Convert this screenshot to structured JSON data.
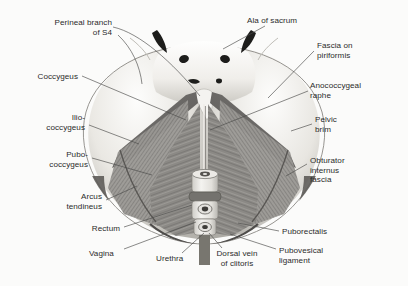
{
  "figure": {
    "view": "superior (from above)",
    "style": "grayscale anatomical illustration with leader-line labels",
    "palette": {
      "background": "#fbfbfa",
      "bone_light": "#f2f1ee",
      "bone_mid": "#cfcdc7",
      "bone_shadow": "#9a9892",
      "muscle_dark": "#6d6b68",
      "muscle_mid": "#8a8885",
      "muscle_hatch": "#7e7c79",
      "fascia": "#aeaca7",
      "organ_light": "#e7e5e0",
      "organ_ring": "#74726e",
      "accent_black": "#1d1d1b",
      "leader_line": "#4a4a48",
      "label_text": "#2b2b2b"
    },
    "labels": [
      {
        "id": "perineal-branch-s4",
        "text": "Perineal branch\nof S4",
        "side": "left",
        "x": 34,
        "y": 18,
        "align": "right",
        "anchor_x": 200,
        "anchor_y": 96
      },
      {
        "id": "coccygeus",
        "text": "Coccygeus",
        "side": "left",
        "x": 30,
        "y": 72,
        "align": "right",
        "anchor_x": 186,
        "anchor_y": 120
      },
      {
        "id": "iliococcygeus",
        "text": "Ilio-\ncoccygeus",
        "side": "left",
        "x": 41,
        "y": 113,
        "align": "right",
        "anchor_x": 139,
        "anchor_y": 144
      },
      {
        "id": "pubococcygeus",
        "text": "Pubo-\ncoccygeus",
        "side": "left",
        "x": 39,
        "y": 150,
        "align": "right",
        "anchor_x": 152,
        "anchor_y": 175
      },
      {
        "id": "arcus-tendineus",
        "text": "Arcus\ntendineus",
        "side": "left",
        "x": 59,
        "y": 192,
        "align": "right",
        "anchor_x": 137,
        "anchor_y": 186
      },
      {
        "id": "rectum",
        "text": "Rectum",
        "side": "left",
        "x": 83,
        "y": 224,
        "align": "right",
        "anchor_x": 192,
        "anchor_y": 205
      },
      {
        "id": "vagina",
        "text": "Vagina",
        "side": "bottom",
        "x": 96,
        "y": 249,
        "align": "left",
        "anchor_x": 196,
        "anchor_y": 222
      },
      {
        "id": "urethra",
        "text": "Urethra",
        "side": "bottom",
        "x": 163,
        "y": 255,
        "align": "left",
        "anchor_x": 204,
        "anchor_y": 232
      },
      {
        "id": "dorsal-vein-clitoris",
        "text": "Dorsal vein\nof clitoris",
        "side": "bottom",
        "x": 215,
        "y": 250,
        "align": "left",
        "anchor_x": 210,
        "anchor_y": 230
      },
      {
        "id": "pubovesical-ligament",
        "text": "Pubovesical\nligament",
        "side": "right",
        "x": 279,
        "y": 246,
        "align": "left",
        "anchor_x": 232,
        "anchor_y": 232
      },
      {
        "id": "puborectalis",
        "text": "Puborectalis",
        "side": "right",
        "x": 282,
        "y": 228,
        "align": "left",
        "anchor_x": 236,
        "anchor_y": 222
      },
      {
        "id": "obturator-internus-fascia",
        "text": "Obturator\ninternus\nfascia",
        "side": "right",
        "x": 310,
        "y": 157,
        "align": "left",
        "anchor_x": 286,
        "anchor_y": 175
      },
      {
        "id": "pelvic-brim",
        "text": "Pelvic\nbrim",
        "side": "right",
        "x": 315,
        "y": 116,
        "align": "left",
        "anchor_x": 290,
        "anchor_y": 131
      },
      {
        "id": "anococcygeal-raphe",
        "text": "Anococcygeal\nraphe",
        "side": "right",
        "x": 311,
        "y": 82,
        "align": "left",
        "anchor_x": 209,
        "anchor_y": 130
      },
      {
        "id": "fascia-on-piriformis",
        "text": "Fascia on\npiriformis",
        "side": "right",
        "x": 317,
        "y": 42,
        "align": "left",
        "anchor_x": 268,
        "anchor_y": 98
      },
      {
        "id": "ala-of-sacrum",
        "text": "Ala of sacrum",
        "side": "top",
        "x": 248,
        "y": 17,
        "align": "left",
        "anchor_x": 222,
        "anchor_y": 48
      }
    ],
    "structures": [
      {
        "id": "sacrum",
        "name": "sacrum with sacral foramina"
      },
      {
        "id": "sacral-horns",
        "name": "paired dark superior processes"
      },
      {
        "id": "coccygeus-left",
        "name": "left coccygeus muscle band"
      },
      {
        "id": "coccygeus-right",
        "name": "right coccygeus muscle band"
      },
      {
        "id": "iliococcygeus-left",
        "name": "left iliococcygeus, cross-hatched"
      },
      {
        "id": "iliococcygeus-right",
        "name": "right iliococcygeus, cross-hatched"
      },
      {
        "id": "pubococcygeus-left",
        "name": "left pubococcygeus, fibrous"
      },
      {
        "id": "pubococcygeus-right",
        "name": "right pubococcygeus, fibrous"
      },
      {
        "id": "organ-column",
        "name": "midline rectum, vagina and urethra cross-sections"
      },
      {
        "id": "pubic-region",
        "name": "anterior pubic bone and symphysis"
      }
    ]
  }
}
